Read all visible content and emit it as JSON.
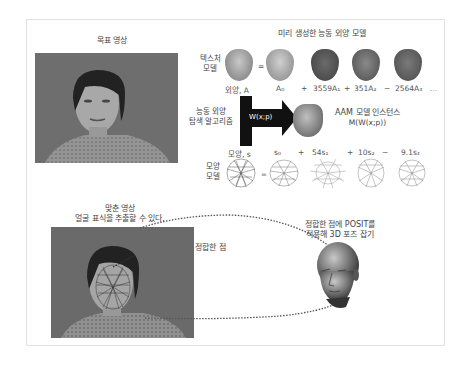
{
  "diagram": {
    "frame_title": "AAM face fitting and POSIT pose estimation pipeline",
    "target_image": {
      "label": "목표 영상"
    },
    "prebuilt_model": {
      "title": "미리 생성한 능동 외양 모델",
      "texture_model_label_line1": "텍스처",
      "texture_model_label_line2": "모델",
      "texture_equation": {
        "lhs": "외양, A",
        "terms": [
          "A₀",
          "+",
          "3559A₁",
          "+",
          "351A₂",
          "−",
          "2564A₃",
          "..."
        ],
        "equals": "="
      },
      "shape_model_label_line1": "모양",
      "shape_model_label_line2": "모델",
      "shape_equation": {
        "lhs": "모양, s",
        "terms": [
          "s₀",
          "+",
          "54s₁",
          "+",
          "10s₂",
          "−",
          "9.1s₃"
        ],
        "equals": "="
      }
    },
    "search_algorithm": {
      "label_line1": "능동 외양",
      "label_line2": "탐색 알고리즘",
      "arrow_label": "W(x;p)"
    },
    "aam_instance": {
      "label_line1": "AAM 모델 인스턴스",
      "label_line2": "M(W(x;p))"
    },
    "fitted_image": {
      "label_line1": "맞춘 영상",
      "label_line2": "얼굴 표식을 추출할 수 있다."
    },
    "matched_points": {
      "label": "정합한 점"
    },
    "posit": {
      "label_line1": "정합한 점에 POSIT를",
      "label_line2": "적용해 3D 포즈 잡기"
    },
    "colors": {
      "frame_border": "#e2e2e2",
      "photo_bg": "#6a6a6a",
      "arrow": "#111111",
      "text": "#444444",
      "dotted_line": "#555555"
    }
  }
}
